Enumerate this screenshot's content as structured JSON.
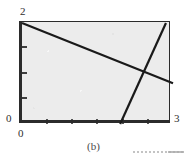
{
  "figure": {
    "caption": "(b)",
    "background_color": "#ffffff",
    "plot_background_color": "#ececec",
    "axis_color": "#2b2b2b",
    "line_color": "#1a1a1a"
  },
  "axes": {
    "y_label_max": "2",
    "y_label_min": "0",
    "x_label_min": "0",
    "x_label_max": "3",
    "x_range": [
      0,
      3
    ],
    "y_range": [
      0,
      2
    ],
    "x_ticks": [
      0.5,
      1.0,
      1.5,
      2.0,
      2.5
    ],
    "y_ticks": [
      0.5,
      1.0,
      1.5
    ]
  },
  "chart_data": {
    "type": "line",
    "title": "(b)",
    "xlabel": "",
    "ylabel": "",
    "xlim": [
      0,
      3
    ],
    "ylim": [
      0,
      2
    ],
    "grid": false,
    "legend": "none",
    "xticks": [
      0,
      0.5,
      1.0,
      1.5,
      2.0,
      2.5,
      3.0
    ],
    "xticklabels": [
      "0",
      "",
      "",
      "",
      "",
      "",
      "3"
    ],
    "yticks": [
      0,
      0.5,
      1.0,
      1.5,
      2.0
    ],
    "yticklabels": [
      "0",
      "",
      "",
      "",
      "2"
    ],
    "series": [
      {
        "name": "descending-constraint-line",
        "x": [
          0.0,
          3.0
        ],
        "y": [
          1.98,
          0.8
        ]
      },
      {
        "name": "ascending-constraint-line",
        "x": [
          1.95,
          2.86
        ],
        "y": [
          0.0,
          1.98
        ]
      }
    ],
    "annotations": [
      {
        "label": "intersection",
        "x": 2.48,
        "y": 1.01
      }
    ]
  }
}
